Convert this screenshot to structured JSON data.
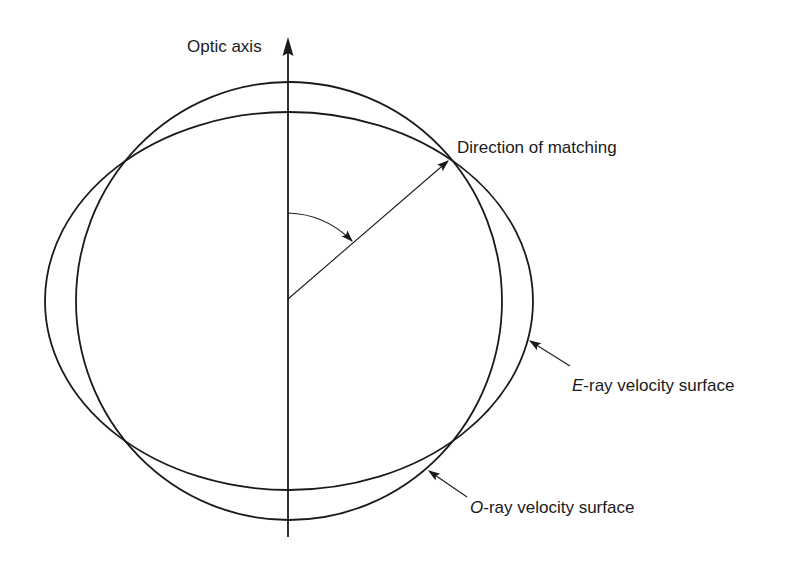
{
  "diagram": {
    "colors": {
      "stroke": "#1a1a1a",
      "background": "#ffffff"
    },
    "labels": {
      "optic_axis": "Optic axis",
      "direction": "Direction of matching",
      "e_ray_prefix": "E",
      "e_ray_rest": "-ray velocity surface",
      "o_ray_prefix": "O",
      "o_ray_rest": "-ray velocity surface"
    },
    "shapes": {
      "o_ray_surface": {
        "type": "circle",
        "cx": 289,
        "cy": 301,
        "rx": 213,
        "ry": 219
      },
      "e_ray_surface": {
        "type": "ellipse",
        "cx": 289,
        "cy": 301,
        "rx": 244,
        "ry": 189
      },
      "optic_axis_line": {
        "x": 288,
        "y_top": 38,
        "y_bottom": 537
      },
      "direction_vector": {
        "from": [
          288,
          299
        ],
        "to": [
          449,
          160
        ]
      },
      "angle_arc": {
        "from": [
          288,
          213
        ],
        "to": [
          353,
          243
        ]
      }
    }
  }
}
